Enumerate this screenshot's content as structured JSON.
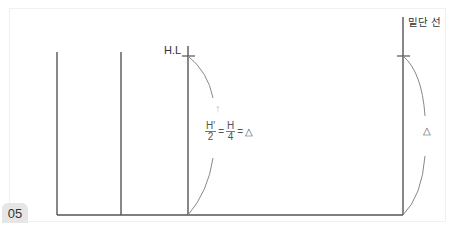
{
  "figure": {
    "number": "05",
    "labels": {
      "high_water": "H.L",
      "baseline": "밑단 선",
      "arrow": "↑",
      "delta_right": "△"
    },
    "formula": {
      "frac1_num": "H'",
      "frac1_den": "2",
      "eq1": "=",
      "frac2_num": "H",
      "frac2_den": "4",
      "eq2": "=",
      "result": "△"
    },
    "colors": {
      "line": "#555555",
      "curve": "#888888",
      "badge_bg": "#e6e6e6"
    }
  }
}
